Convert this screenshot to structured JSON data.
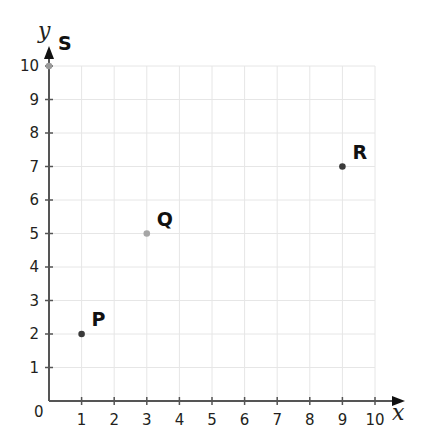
{
  "chart_data": {
    "type": "scatter",
    "title": "",
    "xlabel": "x",
    "ylabel": "y",
    "xlim": [
      0,
      10
    ],
    "ylim": [
      0,
      10
    ],
    "grid": true,
    "x_ticks": [
      "1",
      "2",
      "3",
      "4",
      "5",
      "6",
      "7",
      "8",
      "9",
      "10"
    ],
    "y_ticks": [
      "1",
      "2",
      "3",
      "4",
      "5",
      "6",
      "7",
      "8",
      "9",
      "10"
    ],
    "origin_label": "0",
    "points": [
      {
        "label": "P",
        "x": 1,
        "y": 2,
        "color": "#3a3a3a"
      },
      {
        "label": "Q",
        "x": 3,
        "y": 5,
        "color": "#a6a6a6"
      },
      {
        "label": "R",
        "x": 9,
        "y": 7,
        "color": "#3a3a3a"
      },
      {
        "label": "S",
        "x": 0,
        "y": 10,
        "color": "#9a9a9a"
      }
    ]
  },
  "colors": {
    "axis": "#555555",
    "grid": "#e6e6e6",
    "text": "#231f20"
  }
}
